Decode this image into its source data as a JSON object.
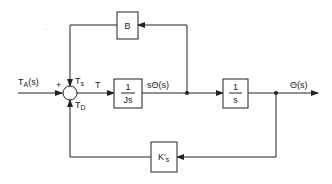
{
  "diagram": {
    "type": "block-diagram",
    "input_label": "T",
    "input_sub": "A",
    "input_arg": "(s)",
    "sum_plus": "+",
    "sum_top_label": "T",
    "sum_top_sub": "s",
    "sum_bottom_label": "T",
    "sum_bottom_sub": "D",
    "torque_label": "T",
    "block_js": {
      "num": "1",
      "den": "Js"
    },
    "velocity_label": "sΘ(s)",
    "block_s": {
      "num": "1",
      "den": "s"
    },
    "output_label": "Θ(s)",
    "block_b": {
      "label": "B"
    },
    "block_k": {
      "label": "K",
      "prime": "′",
      "sub": "s"
    },
    "line_color": "#222222"
  }
}
